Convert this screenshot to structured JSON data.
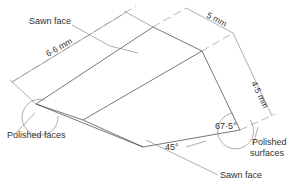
{
  "diagram": {
    "labels": {
      "sawn_face_top": "Sawn face",
      "sawn_face_bottom": "Sawn face",
      "polished_faces": "Polished faces",
      "polished_surfaces_line1": "Polished",
      "polished_surfaces_line2": "surfaces"
    },
    "dimensions": {
      "length": "6·6 mm",
      "width": "5 mm",
      "height": "4·5 mm"
    },
    "angles": {
      "right_angle": "67·5°",
      "bottom_angle": "45°"
    },
    "colors": {
      "line": "#555555",
      "text": "#333333",
      "background": "#ffffff"
    }
  }
}
